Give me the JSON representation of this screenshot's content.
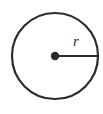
{
  "figure": {
    "kind": "circle-radius-diagram",
    "background_color": "#ffffff",
    "stroke_color": "#2b2b2b",
    "label_color": "#2b2b2b",
    "circle": {
      "center_x": 55,
      "center_y": 56,
      "radius": 43,
      "stroke_width": 2.2
    },
    "center_dot": {
      "center_x": 55,
      "center_y": 56,
      "radius": 4.2
    },
    "radius_line": {
      "x1": 55,
      "y1": 56,
      "x2": 99,
      "y2": 56,
      "stroke_width": 2.2
    },
    "radius_label": {
      "text": "r",
      "x": 76,
      "y": 46
    }
  }
}
